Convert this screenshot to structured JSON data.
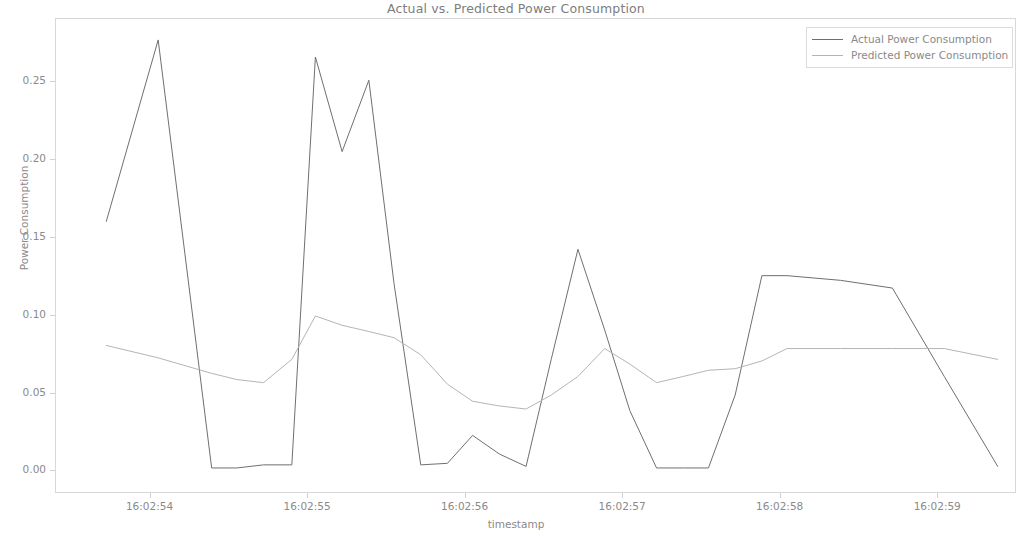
{
  "chart_data": {
    "type": "line",
    "title": "Actual vs. Predicted Power Consumption",
    "xlabel": "timestamp",
    "ylabel": "Power Consumption",
    "grid": false,
    "legend_position": "upper right",
    "xtick_labels": [
      "16:02:54",
      "16:02:55",
      "16:02:56",
      "16:02:57",
      "16:02:58",
      "16:02:59"
    ],
    "xtick_values": [
      54,
      55,
      56,
      57,
      58,
      59
    ],
    "ytick_labels": [
      "0.00",
      "0.05",
      "0.10",
      "0.15",
      "0.20",
      "0.25"
    ],
    "ytick_values": [
      0.0,
      0.05,
      0.1,
      0.15,
      0.2,
      0.25
    ],
    "xlim": [
      53.4,
      59.5
    ],
    "ylim": [
      -0.0145,
      0.2905
    ],
    "x": [
      53.72,
      54.05,
      54.39,
      54.55,
      54.72,
      54.9,
      55.05,
      55.22,
      55.39,
      55.55,
      55.72,
      55.89,
      56.05,
      56.22,
      56.39,
      56.55,
      56.72,
      56.89,
      57.05,
      57.22,
      57.39,
      57.55,
      57.72,
      57.89,
      58.05,
      58.39,
      58.72,
      59.05,
      59.39
    ],
    "series": [
      {
        "name": "Actual Power Consumption",
        "color": "#6e6e6e",
        "values": [
          0.16,
          0.277,
          0.001,
          0.001,
          0.003,
          0.003,
          0.266,
          0.205,
          0.251,
          0.12,
          0.003,
          0.004,
          0.022,
          0.01,
          0.002,
          0.071,
          0.142,
          0.09,
          0.038,
          0.001,
          0.001,
          0.001,
          0.048,
          0.125,
          0.125,
          0.122,
          0.117,
          0.06,
          0.002
        ]
      },
      {
        "name": "Predicted Power Consumption",
        "color": "#b4b4b4",
        "values": [
          0.08,
          0.072,
          0.062,
          0.058,
          0.056,
          0.071,
          0.099,
          0.093,
          0.089,
          0.085,
          0.074,
          0.055,
          0.044,
          0.041,
          0.039,
          0.048,
          0.06,
          0.078,
          0.068,
          0.056,
          0.06,
          0.064,
          0.065,
          0.07,
          0.078,
          0.078,
          0.078,
          0.078,
          0.071
        ]
      }
    ]
  },
  "legend": {
    "entries": [
      {
        "label": "Actual Power Consumption"
      },
      {
        "label": "Predicted Power Consumption"
      }
    ]
  }
}
